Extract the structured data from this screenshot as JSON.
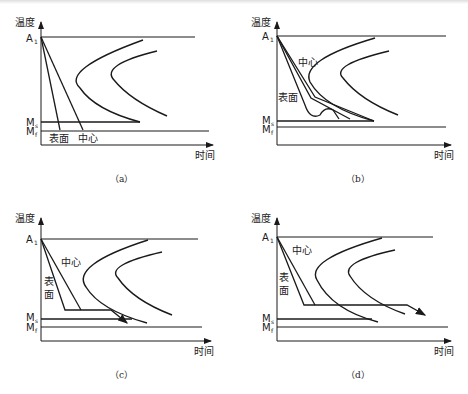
{
  "figure": {
    "axis_y_label": "温度",
    "axis_x_label": "时间",
    "a1_label": "A",
    "a1_sub": "1",
    "ms_label": "M",
    "ms_sub": "s",
    "mf_label": "M",
    "mf_sub": "f",
    "surface_label": "表面",
    "surface_label_v1": "表",
    "surface_label_v2": "面",
    "center_label": "中心",
    "line_color": "#1a1a1a"
  },
  "panels": [
    {
      "id": "a",
      "caption": "（a）"
    },
    {
      "id": "b",
      "caption": "（b）"
    },
    {
      "id": "c",
      "caption": "（c）"
    },
    {
      "id": "d",
      "caption": "（d）"
    }
  ]
}
